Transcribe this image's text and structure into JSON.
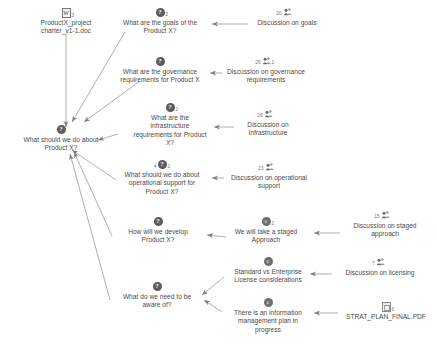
{
  "map": {
    "title": "Product X issue map",
    "canvas": {
      "width": 437,
      "height": 355,
      "background": "#ffffff"
    },
    "link_color": "#8d8d8d",
    "text_color": "#4b4b4b"
  },
  "nodes": [
    {
      "id": "doc-charter",
      "kind": "document",
      "icon": "word-document-icon",
      "label": "ProductX_project\ncharter_v1-1.doc",
      "badge_right": "3",
      "badge_left": "",
      "x": 18,
      "y": 8,
      "w": 96
    },
    {
      "id": "q-root",
      "kind": "question",
      "icon": "question-node-icon",
      "label": "What should we do about\nProduct X?",
      "badge_right": "",
      "badge_left": "",
      "x": 2,
      "y": 125,
      "w": 118
    },
    {
      "id": "q-goals",
      "kind": "question",
      "icon": "question-node-icon",
      "label": "What are the goals of the\nProduct X?",
      "badge_right": "2",
      "badge_left": "",
      "x": 108,
      "y": 8,
      "w": 104
    },
    {
      "id": "q-governance",
      "kind": "question",
      "icon": "question-node-icon",
      "label": "What are the governance\nrequirements for Product X",
      "badge_right": "",
      "badge_left": "",
      "x": 106,
      "y": 57,
      "w": 108
    },
    {
      "id": "q-infrastructure",
      "kind": "question",
      "icon": "question-node-icon",
      "label": "What are the\ninfrastructure\nrequirements for Product\nX?",
      "badge_right": "2",
      "badge_left": "",
      "x": 122,
      "y": 103,
      "w": 96
    },
    {
      "id": "q-operational",
      "kind": "question",
      "icon": "question-node-icon",
      "label": "What should we do about\noperational support for\nProduct X?",
      "badge_right": "2",
      "badge_left": "4",
      "x": 110,
      "y": 160,
      "w": 104
    },
    {
      "id": "q-develop",
      "kind": "question",
      "icon": "question-node-icon",
      "label": "How will we develop\nProduct X?",
      "badge_right": "",
      "badge_left": "",
      "x": 108,
      "y": 217,
      "w": 100
    },
    {
      "id": "q-aware",
      "kind": "question",
      "icon": "question-node-icon",
      "label": "What do we need to be\naware of?",
      "badge_right": "",
      "badge_left": "",
      "x": 104,
      "y": 282,
      "w": 106
    },
    {
      "id": "d-goals",
      "kind": "discussion",
      "icon": "discussion-node-icon",
      "label": "Discussion on goals",
      "badge_right": "",
      "badge_left": "20",
      "x": 240,
      "y": 8,
      "w": 94
    },
    {
      "id": "d-governance",
      "kind": "discussion",
      "icon": "discussion-node-icon",
      "label": "Discussion on governance\nrequirements",
      "badge_right": "2",
      "badge_left": "26",
      "x": 213,
      "y": 57,
      "w": 106
    },
    {
      "id": "d-infrastructure",
      "kind": "discussion",
      "icon": "discussion-node-icon",
      "label": "Discussion on\nInfrastructure",
      "badge_right": "",
      "badge_left": "26",
      "x": 228,
      "y": 110,
      "w": 80
    },
    {
      "id": "d-operational",
      "kind": "discussion",
      "icon": "discussion-node-icon",
      "label": "Discussion on operational\nsupport",
      "badge_right": "",
      "badge_left": "23",
      "x": 216,
      "y": 163,
      "w": 106
    },
    {
      "id": "a-staged",
      "kind": "answer",
      "icon": "answer-node-icon",
      "label": "We will take a staged\nApproach",
      "badge_right": "2",
      "badge_left": "",
      "x": 220,
      "y": 217,
      "w": 92
    },
    {
      "id": "a-license",
      "kind": "answer",
      "icon": "answer-node-icon",
      "label": "Standard vs Enterprise\nLicense considerations",
      "badge_right": "",
      "badge_left": "",
      "x": 216,
      "y": 257,
      "w": 104
    },
    {
      "id": "a-infoplan",
      "kind": "answer",
      "icon": "answer-node-icon",
      "label": "There is an information\nmanagement plan in\nprogress",
      "badge_right": "",
      "badge_left": "",
      "x": 216,
      "y": 298,
      "w": 104
    },
    {
      "id": "d-staged",
      "kind": "discussion",
      "icon": "discussion-node-icon",
      "label": "Discussion on staged\napproach",
      "badge_right": "",
      "badge_left": "15",
      "x": 338,
      "y": 211,
      "w": 94
    },
    {
      "id": "d-licensing",
      "kind": "discussion",
      "icon": "discussion-node-icon",
      "label": "Discussion on licensing",
      "badge_right": "",
      "badge_left": "7",
      "x": 330,
      "y": 258,
      "w": 100
    },
    {
      "id": "doc-strat",
      "kind": "document",
      "icon": "pdf-document-icon",
      "label": "STRAT_PLAN_FINAL.PDF",
      "badge_right": "6",
      "badge_left": "",
      "x": 336,
      "y": 302,
      "w": 100
    }
  ],
  "edges": [
    {
      "from": "doc-charter",
      "to": "q-root",
      "x1": 66,
      "y1": 33,
      "x2": 66,
      "y2": 127
    },
    {
      "from": "q-goals",
      "to": "q-root",
      "x1": 125,
      "y1": 32,
      "x2": 72,
      "y2": 122
    },
    {
      "from": "q-governance",
      "to": "q-root",
      "x1": 140,
      "y1": 81,
      "x2": 84,
      "y2": 122
    },
    {
      "from": "q-infrastructure",
      "to": "q-root",
      "x1": 118,
      "y1": 134,
      "x2": 98,
      "y2": 140
    },
    {
      "from": "q-operational",
      "to": "q-root",
      "x1": 116,
      "y1": 180,
      "x2": 72,
      "y2": 150
    },
    {
      "from": "q-develop",
      "to": "q-root",
      "x1": 112,
      "y1": 236,
      "x2": 74,
      "y2": 152
    },
    {
      "from": "q-aware",
      "to": "q-root",
      "x1": 110,
      "y1": 300,
      "x2": 70,
      "y2": 154
    },
    {
      "from": "d-goals",
      "to": "q-goals",
      "x1": 248,
      "y1": 24,
      "x2": 212,
      "y2": 24
    },
    {
      "from": "d-governance",
      "to": "q-governance",
      "x1": 222,
      "y1": 73,
      "x2": 210,
      "y2": 73
    },
    {
      "from": "d-infrastructure",
      "to": "q-infrastructure",
      "x1": 234,
      "y1": 127,
      "x2": 214,
      "y2": 127
    },
    {
      "from": "d-operational",
      "to": "q-operational",
      "x1": 224,
      "y1": 178,
      "x2": 212,
      "y2": 178
    },
    {
      "from": "a-staged",
      "to": "q-develop",
      "x1": 226,
      "y1": 237,
      "x2": 207,
      "y2": 235
    },
    {
      "from": "a-license",
      "to": "q-aware",
      "x1": 224,
      "y1": 277,
      "x2": 202,
      "y2": 295
    },
    {
      "from": "a-infoplan",
      "to": "q-aware",
      "x1": 222,
      "y1": 312,
      "x2": 204,
      "y2": 300
    },
    {
      "from": "d-staged",
      "to": "a-staged",
      "x1": 340,
      "y1": 233,
      "x2": 314,
      "y2": 233
    },
    {
      "from": "d-licensing",
      "to": "a-license",
      "x1": 332,
      "y1": 274,
      "x2": 310,
      "y2": 274
    },
    {
      "from": "doc-strat",
      "to": "a-infoplan",
      "x1": 338,
      "y1": 313,
      "x2": 314,
      "y2": 313
    }
  ]
}
